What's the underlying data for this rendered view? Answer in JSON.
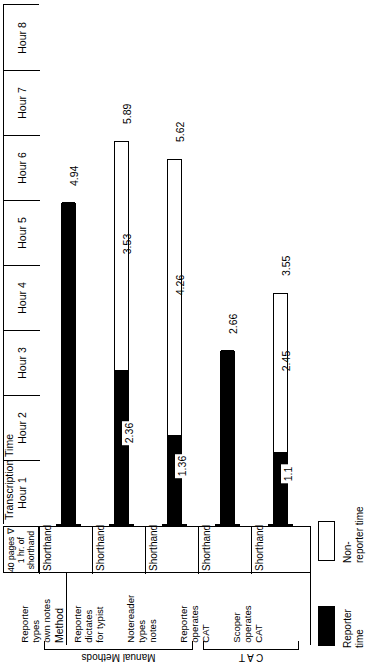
{
  "axis": {
    "title": "Transcription Time",
    "hours": [
      "Hour 1",
      "Hour 2",
      "Hour 3",
      "Hour 4",
      "Hour 5",
      "Hour 6",
      "Hour 7",
      "Hour 8"
    ],
    "max_hours": 8
  },
  "header_cell": {
    "line1": "40 pages ∇",
    "line2": "1 hr. of",
    "line3": "shorthand"
  },
  "row_header": {
    "shorthand_label": "Shorthand",
    "method_label": "Method"
  },
  "groups": [
    {
      "label": "Manual Methods",
      "members": [
        0,
        1,
        2
      ]
    },
    {
      "label": "C A T",
      "members": [
        3,
        4
      ]
    }
  ],
  "legend": {
    "reporter": {
      "label": "Reporter\ntime",
      "color": "#000000"
    },
    "non_reporter": {
      "label": "Non-\nreporter time",
      "color": "#ffffff"
    }
  },
  "chart_data": {
    "type": "bar",
    "orientation": "vertical-rotated-90",
    "title": "Transcription Time",
    "xlabel": "Method",
    "ylabel": "Transcription Time",
    "ylim": [
      0,
      8
    ],
    "ytick_labels": [
      "Hour 1",
      "Hour 2",
      "Hour 3",
      "Hour 4",
      "Hour 5",
      "Hour 6",
      "Hour 7",
      "Hour 8"
    ],
    "grid": false,
    "legend_position": "bottom-right",
    "stacked": true,
    "unit": "hours",
    "categories": [
      "Reporter\ntypes\nown notes",
      "Reporter\ndictates\nfor typist",
      "Notereader\ntypes\nnotes",
      "Reporter\noperates\nCAT",
      "Scoper\noperates\nCAT"
    ],
    "row_labels": [
      "Shorthand",
      "Shorthand",
      "Shorthand",
      "Shorthand",
      "Shorthand"
    ],
    "series": [
      {
        "name": "Reporter time",
        "color": "#000000",
        "values": [
          4.94,
          2.36,
          1.36,
          2.66,
          1.1
        ]
      },
      {
        "name": "Non-reporter time",
        "color": "#ffffff",
        "values": [
          0,
          3.53,
          4.26,
          0,
          2.45
        ]
      }
    ],
    "totals": [
      4.94,
      5.89,
      5.62,
      2.66,
      3.55
    ],
    "bars": [
      {
        "category": "Reporter types own notes",
        "group": "Manual Methods",
        "reporter": 4.94,
        "non_reporter": 0,
        "total": 4.94,
        "reporter_label": "4.94",
        "non_reporter_label": "",
        "total_label": "4.94"
      },
      {
        "category": "Reporter dictates for typist",
        "group": "Manual Methods",
        "reporter": 2.36,
        "non_reporter": 3.53,
        "total": 5.89,
        "reporter_label": "2.36",
        "non_reporter_label": "3.53",
        "total_label": "5.89"
      },
      {
        "category": "Notereader types notes",
        "group": "Manual Methods",
        "reporter": 1.36,
        "non_reporter": 4.26,
        "total": 5.62,
        "reporter_label": "1.36",
        "non_reporter_label": "4.26",
        "total_label": "5.62"
      },
      {
        "category": "Reporter operates CAT",
        "group": "C A T",
        "reporter": 2.66,
        "non_reporter": 0,
        "total": 2.66,
        "reporter_label": "2.66",
        "non_reporter_label": "",
        "total_label": "2.66"
      },
      {
        "category": "Scoper operates CAT",
        "group": "C A T",
        "reporter": 1.1,
        "non_reporter": 2.45,
        "total": 3.55,
        "reporter_label": "1.1",
        "non_reporter_label": "2.45",
        "total_label": "3.55"
      }
    ]
  }
}
